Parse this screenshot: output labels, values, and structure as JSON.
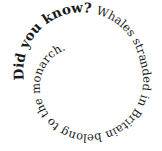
{
  "spiral_text": {
    "heading": "Did you know? ",
    "body": "Whales stranded in Britain belong to the monarch.",
    "color": "#1a1a1a",
    "background": "#ffffff"
  }
}
